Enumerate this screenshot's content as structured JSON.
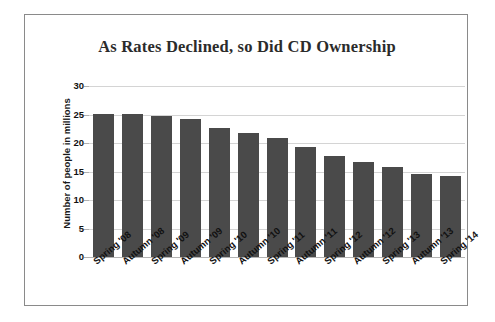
{
  "chart_data": {
    "type": "bar",
    "title": "As Rates Declined, so Did CD Ownership",
    "xlabel": "",
    "ylabel": "Number of people in millions",
    "categories": [
      "Spring '08",
      "Autumn '08",
      "Spring '09",
      "Autumn '09",
      "Spring '10",
      "Autumn '10",
      "Spring '11",
      "Autumn '11",
      "Spring '12",
      "Autumn '12",
      "Spring '13",
      "Autumn '13",
      "Spring '14"
    ],
    "values": [
      25.1,
      25.1,
      24.8,
      24.2,
      22.6,
      21.8,
      20.8,
      19.3,
      17.8,
      16.6,
      15.8,
      14.5,
      14.2
    ],
    "ylim": [
      0,
      30
    ],
    "yticks": [
      0,
      5,
      10,
      15,
      20,
      25,
      30
    ],
    "ytick_labels": [
      "0",
      "5",
      "10",
      "15",
      "20",
      "25",
      "30"
    ],
    "grid": true,
    "legend": false,
    "bar_color": "#4a4a4a",
    "gridline_color": "#d4d4d4",
    "frame_color": "#8a8a8a",
    "title_color": "#2b2b2b"
  }
}
